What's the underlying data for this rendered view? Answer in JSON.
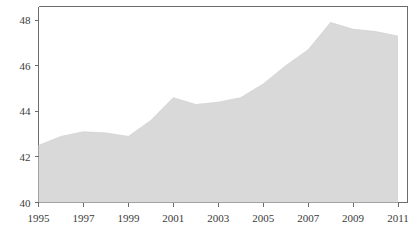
{
  "chart_data": {
    "type": "area",
    "title": "",
    "subtitle": "",
    "xlabel": "",
    "ylabel": "",
    "x": [
      1995,
      1996,
      1997,
      1998,
      1999,
      2000,
      2001,
      2002,
      2003,
      2004,
      2005,
      2006,
      2007,
      2008,
      2009,
      2010,
      2011
    ],
    "values": [
      42.5,
      42.9,
      43.1,
      43.05,
      42.9,
      43.6,
      44.6,
      44.3,
      44.4,
      44.6,
      45.2,
      46.0,
      46.7,
      47.9,
      47.6,
      47.5,
      47.3
    ],
    "series": [
      {
        "name": "value",
        "values": [
          42.5,
          42.9,
          43.1,
          43.05,
          42.9,
          43.6,
          44.6,
          44.3,
          44.4,
          44.6,
          45.2,
          46.0,
          46.7,
          47.9,
          47.6,
          47.5,
          47.3
        ]
      }
    ],
    "categories": [
      "1995",
      "1996",
      "1997",
      "1998",
      "1999",
      "2000",
      "2001",
      "2002",
      "2003",
      "2004",
      "2005",
      "2006",
      "2007",
      "2008",
      "2009",
      "2010",
      "2011"
    ],
    "xlim": [
      1995,
      2011
    ],
    "ylim": [
      40,
      48.6
    ],
    "xticks": [
      1995,
      1997,
      1999,
      2001,
      2003,
      2005,
      2007,
      2009,
      2011
    ],
    "xtick_labels": [
      "1995",
      "1997",
      "1999",
      "2001",
      "2003",
      "2005",
      "2007",
      "2009",
      "2011"
    ],
    "yticks": [
      40,
      42,
      44,
      46,
      48
    ],
    "ytick_labels": [
      "40",
      "42",
      "44",
      "46",
      "48"
    ],
    "grid": false,
    "legend": null,
    "legend_position": "none",
    "annotations": [],
    "colors": {
      "area_fill": "#d9d9d9",
      "axis": "#6b6b6b",
      "tick_text": "#3b3b3b",
      "background": "#ffffff"
    }
  },
  "axis": {
    "y_labels": [
      "48",
      "46",
      "44",
      "42",
      "40"
    ],
    "x_labels": [
      "1995",
      "1997",
      "1999",
      "2001",
      "2003",
      "2005",
      "2007",
      "2009",
      "2011"
    ]
  }
}
